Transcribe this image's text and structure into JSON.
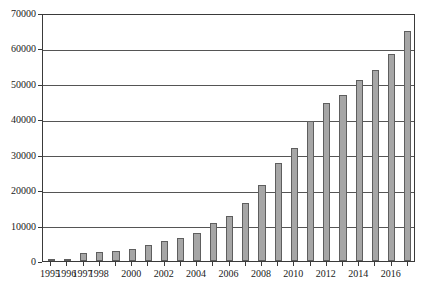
{
  "chart_data": {
    "type": "bar",
    "title": "",
    "subtitle": "",
    "xlabel": "",
    "ylabel": "",
    "grid": "horizontal",
    "legend": "none",
    "ylim": [
      0,
      70000
    ],
    "ytick_interval": 10000,
    "yticks": [
      "0",
      "10000",
      "20000",
      "30000",
      "40000",
      "50000",
      "60000",
      "70000"
    ],
    "ytick_values": [
      0,
      10000,
      20000,
      30000,
      40000,
      50000,
      60000,
      70000
    ],
    "xlim": [
      "1995",
      "2017"
    ],
    "xtick_labels": [
      "1995",
      "1996",
      "1997",
      "1998",
      "2000",
      "2002",
      "2004",
      "2006",
      "2008",
      "2010",
      "2012",
      "2014",
      "2016"
    ],
    "xtick_label_years": [
      1995,
      1996,
      1997,
      1998,
      2000,
      2002,
      2004,
      2006,
      2008,
      2010,
      2012,
      2014,
      2016
    ],
    "categories": [
      "1995",
      "1996",
      "1997",
      "1998",
      "1999",
      "2000",
      "2001",
      "2002",
      "2003",
      "2004",
      "2005",
      "2006",
      "2007",
      "2008",
      "2009",
      "2010",
      "2011",
      "2012",
      "2013",
      "2014",
      "2015",
      "2016",
      "2017"
    ],
    "values": [
      200,
      400,
      2400,
      2500,
      2900,
      3400,
      4400,
      5600,
      6400,
      8000,
      10600,
      12800,
      16500,
      21500,
      27600,
      31800,
      39500,
      44500,
      47000,
      51000,
      54000,
      58500,
      65000
    ],
    "bar_color": "#a6a6a6",
    "bar_edge_color": "#5e5e5e",
    "gridline_color": "#555555",
    "frame_color": "#3a3a3a",
    "background_color": "#ffffff"
  }
}
